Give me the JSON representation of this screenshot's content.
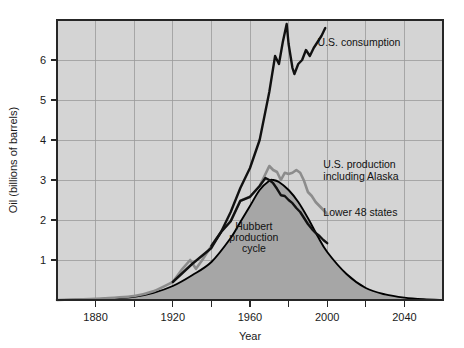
{
  "chart_data": {
    "type": "line",
    "title": "",
    "xlabel": "Year",
    "ylabel": "Oil (billions of barrels)",
    "xlim": [
      1860,
      2060
    ],
    "ylim": [
      0,
      7
    ],
    "grid": true,
    "legend_position": "inline-annotations",
    "xticks_major": [
      1880,
      1920,
      1960,
      2000,
      2040
    ],
    "xticks_minor": [
      1900,
      1940,
      1980,
      2020
    ],
    "xtick_labels": [
      "1880",
      "1920",
      "1960",
      "2000",
      "2040"
    ],
    "yticks": [
      1,
      2,
      3,
      4,
      5,
      6
    ],
    "ytick_labels": [
      "1",
      "2",
      "3",
      "4",
      "5",
      "6"
    ],
    "series": [
      {
        "name": "Hubbert production cycle",
        "style": "filled-area",
        "color": "#000000",
        "fill": "#a6a6a6",
        "x": [
          1860,
          1880,
          1900,
          1910,
          1920,
          1930,
          1940,
          1950,
          1955,
          1960,
          1965,
          1970,
          1972,
          1975,
          1980,
          1985,
          1990,
          1995,
          2000,
          2010,
          2020,
          2030,
          2040,
          2050,
          2060
        ],
        "values": [
          0.0,
          0.02,
          0.08,
          0.18,
          0.35,
          0.62,
          0.95,
          1.55,
          1.95,
          2.35,
          2.75,
          2.98,
          3.0,
          2.95,
          2.75,
          2.45,
          2.05,
          1.6,
          1.2,
          0.65,
          0.3,
          0.14,
          0.06,
          0.02,
          0.0
        ]
      },
      {
        "name": "U.S. production including Alaska",
        "style": "line",
        "color": "#8c8c8c",
        "x": [
          1860,
          1880,
          1900,
          1910,
          1920,
          1925,
          1929,
          1932,
          1935,
          1940,
          1945,
          1950,
          1955,
          1960,
          1965,
          1968,
          1970,
          1972,
          1974,
          1976,
          1978,
          1980,
          1982,
          1984,
          1986,
          1988,
          1990,
          1992,
          1994,
          1996,
          1998,
          2000
        ],
        "values": [
          0.0,
          0.03,
          0.1,
          0.22,
          0.45,
          0.78,
          1.0,
          0.78,
          0.98,
          1.35,
          1.7,
          1.97,
          2.48,
          2.58,
          2.85,
          3.15,
          3.35,
          3.25,
          3.2,
          3.0,
          3.18,
          3.15,
          3.18,
          3.25,
          3.18,
          2.98,
          2.7,
          2.6,
          2.45,
          2.35,
          2.25,
          2.15
        ]
      },
      {
        "name": "Lower 48 states",
        "style": "line",
        "color": "#111111",
        "x": [
          1940,
          1945,
          1950,
          1955,
          1960,
          1965,
          1968,
          1970,
          1972,
          1974,
          1976,
          1978,
          1980,
          1982,
          1984,
          1986,
          1988,
          1990,
          1992,
          1994,
          1996,
          1998,
          2000
        ],
        "values": [
          1.35,
          1.7,
          1.97,
          2.48,
          2.58,
          2.85,
          3.05,
          3.0,
          2.92,
          2.78,
          2.62,
          2.6,
          2.5,
          2.42,
          2.3,
          2.2,
          2.05,
          1.9,
          1.78,
          1.68,
          1.6,
          1.5,
          1.42
        ]
      },
      {
        "name": "U.S. consumption",
        "style": "line",
        "color": "#111111",
        "x": [
          1920,
          1930,
          1940,
          1945,
          1950,
          1955,
          1960,
          1965,
          1970,
          1973,
          1975,
          1977,
          1979,
          1980,
          1982,
          1983,
          1985,
          1987,
          1989,
          1991,
          1993,
          1995,
          1997,
          1999
        ],
        "values": [
          0.45,
          0.9,
          1.3,
          1.7,
          2.2,
          2.8,
          3.3,
          4.0,
          5.2,
          6.1,
          5.9,
          6.45,
          6.9,
          6.4,
          5.8,
          5.65,
          5.9,
          6.0,
          6.25,
          6.1,
          6.3,
          6.45,
          6.6,
          6.8
        ]
      }
    ],
    "annotations": [
      {
        "id": "consumption",
        "text": "U.S. consumption",
        "x": 1995,
        "y": 6.35
      },
      {
        "id": "production-alaska-line1",
        "text": "U.S. production",
        "x": 1998,
        "y": 3.3
      },
      {
        "id": "production-alaska-line2",
        "text": "including Alaska",
        "x": 1998,
        "y": 3.0
      },
      {
        "id": "lower48",
        "text": "Lower 48 states",
        "x": 1998,
        "y": 2.1
      },
      {
        "id": "hubbert-line1",
        "text": "Hubbert",
        "x": 1962,
        "y": 1.75
      },
      {
        "id": "hubbert-line2",
        "text": "production",
        "x": 1962,
        "y": 1.48
      },
      {
        "id": "hubbert-line3",
        "text": "cycle",
        "x": 1962,
        "y": 1.21
      }
    ],
    "colors": {
      "plot_background": "#d4d4d4",
      "figure_background": "#ffffff",
      "grid": "#9a9a9a",
      "frame": "#262626",
      "hubbert_fill": "#a6a6a6",
      "hubbert_line": "#000000",
      "production_alaska": "#8c8c8c",
      "lower48": "#111111",
      "consumption": "#111111"
    }
  }
}
